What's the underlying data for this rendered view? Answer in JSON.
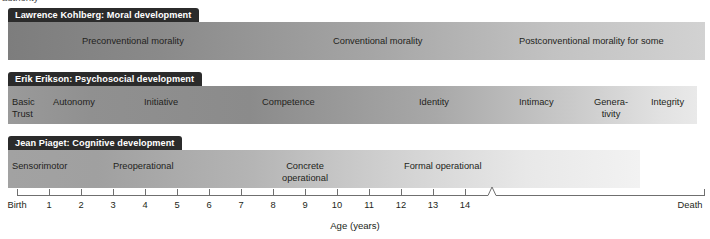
{
  "page": {
    "cropped_top_text": "authority",
    "background_color": "#ffffff",
    "tab_color": "#2b2b2b",
    "tab_text_color": "#ffffff",
    "text_color": "#231f20",
    "axis_color": "#6f6f6f"
  },
  "rows": [
    {
      "tab_label": "Lawrence Kohlberg: Moral development",
      "stages": [
        {
          "label": "Preconventional morality"
        },
        {
          "label": "Conventional morality"
        },
        {
          "label": "Postconventional morality for some"
        }
      ]
    },
    {
      "tab_label": "Erik Erikson: Psychosocial development",
      "stages": [
        {
          "label": "Basic\nTrust"
        },
        {
          "label": "Autonomy"
        },
        {
          "label": "Initiative"
        },
        {
          "label": "Competence"
        },
        {
          "label": "Identity"
        },
        {
          "label": "Intimacy"
        },
        {
          "label": "Genera-\ntivity"
        },
        {
          "label": "Integrity"
        }
      ]
    },
    {
      "tab_label": "Jean Piaget: Cognitive development",
      "stages": [
        {
          "label": "Sensorimotor"
        },
        {
          "label": "Preoperational"
        },
        {
          "label": "Concrete\noperational"
        },
        {
          "label": "Formal operational"
        }
      ]
    }
  ],
  "axis": {
    "title": "Age (years)",
    "start_label": "Birth",
    "end_label": "Death",
    "tick_labels": [
      "1",
      "2",
      "3",
      "4",
      "5",
      "6",
      "7",
      "8",
      "9",
      "10",
      "11",
      "12",
      "13",
      "14"
    ],
    "has_break": true
  }
}
